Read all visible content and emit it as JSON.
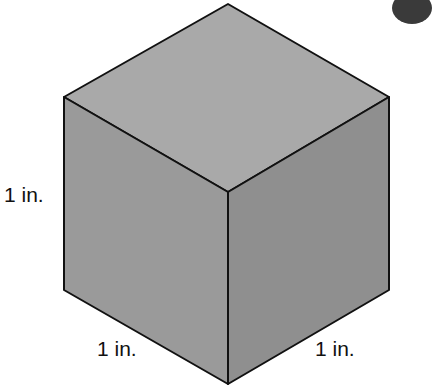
{
  "figure": {
    "shape": "cube",
    "colors": {
      "top_face": "#a9a9a9",
      "left_face": "#9a9a9a",
      "right_face": "#8f8f8f",
      "edge": "#111111",
      "corner_blob": "#3a3a3a"
    },
    "labels": {
      "height": "1 in.",
      "left_depth": "1 in.",
      "right_width": "1 in."
    }
  }
}
